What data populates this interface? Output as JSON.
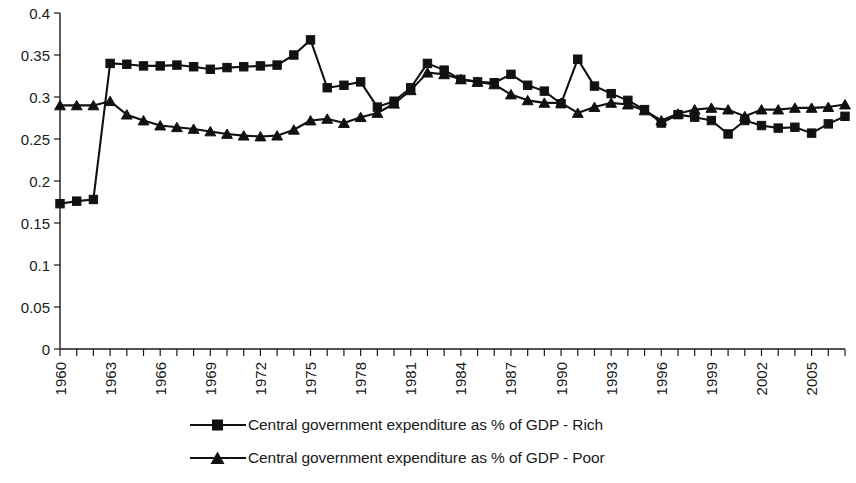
{
  "chart_data": {
    "type": "line",
    "title": "",
    "xlabel": "",
    "ylabel": "",
    "ylim": [
      0,
      0.4
    ],
    "xlim": [
      1960,
      2007
    ],
    "grid": false,
    "legend_position": "bottom",
    "ytick_labels": [
      "0",
      "0.05",
      "0.1",
      "0.15",
      "0.2",
      "0.25",
      "0.3",
      "0.35",
      "0.4"
    ],
    "ytick_values": [
      0,
      0.05,
      0.1,
      0.15,
      0.2,
      0.25,
      0.3,
      0.35,
      0.4
    ],
    "xtick_labels": [
      "1960",
      "1963",
      "1966",
      "1969",
      "1972",
      "1975",
      "1978",
      "1981",
      "1984",
      "1987",
      "1990",
      "1993",
      "1996",
      "1999",
      "2002",
      "2005"
    ],
    "xtick_values": [
      1960,
      1963,
      1966,
      1969,
      1972,
      1975,
      1978,
      1981,
      1984,
      1987,
      1990,
      1993,
      1996,
      1999,
      2002,
      2005
    ],
    "x": [
      1960,
      1961,
      1962,
      1963,
      1964,
      1965,
      1966,
      1967,
      1968,
      1969,
      1970,
      1971,
      1972,
      1973,
      1974,
      1975,
      1976,
      1977,
      1978,
      1979,
      1980,
      1981,
      1982,
      1983,
      1984,
      1985,
      1986,
      1987,
      1988,
      1989,
      1990,
      1991,
      1992,
      1993,
      1994,
      1995,
      1996,
      1997,
      1998,
      1999,
      2000,
      2001,
      2002,
      2003,
      2004,
      2005,
      2006,
      2007
    ],
    "series": [
      {
        "name": "Central government expenditure as % of GDP - Rich",
        "marker": "square",
        "values": [
          0.173,
          0.176,
          0.178,
          0.34,
          0.339,
          0.337,
          0.337,
          0.338,
          0.336,
          0.333,
          0.335,
          0.336,
          0.337,
          0.338,
          0.35,
          0.368,
          0.311,
          0.314,
          0.318,
          0.288,
          0.295,
          0.311,
          0.34,
          0.332,
          0.321,
          0.318,
          0.317,
          0.327,
          0.314,
          0.307,
          0.292,
          0.345,
          0.313,
          0.304,
          0.296,
          0.285,
          0.269,
          0.279,
          0.276,
          0.272,
          0.256,
          0.272,
          0.266,
          0.263,
          0.264,
          0.257,
          0.268,
          0.277
        ]
      },
      {
        "name": "Central government expenditure as % of GDP - Poor",
        "marker": "triangle",
        "values": [
          0.29,
          0.29,
          0.29,
          0.295,
          0.279,
          0.272,
          0.266,
          0.264,
          0.262,
          0.259,
          0.256,
          0.254,
          0.253,
          0.254,
          0.261,
          0.272,
          0.274,
          0.269,
          0.276,
          0.281,
          0.292,
          0.308,
          0.329,
          0.327,
          0.321,
          0.318,
          0.315,
          0.303,
          0.296,
          0.293,
          0.293,
          0.281,
          0.288,
          0.293,
          0.291,
          0.284,
          0.272,
          0.28,
          0.285,
          0.287,
          0.285,
          0.277,
          0.285,
          0.285,
          0.287,
          0.287,
          0.288,
          0.291
        ]
      }
    ]
  }
}
